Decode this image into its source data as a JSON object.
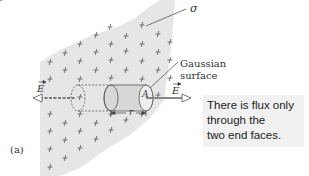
{
  "figure": {
    "part_label": "(a)",
    "sheet_label": "σ",
    "surface_label_line1": "Gaussian",
    "surface_label_line2": "surface",
    "field_left_label": "E",
    "field_right_label": "E",
    "area_label": "A",
    "radius_label": "r",
    "callout": {
      "line1": "There is flux only",
      "line2": "through the",
      "line3": "two end faces."
    },
    "colors": {
      "sheet_fill": "#e6e6e6",
      "charge_mark": "#555555",
      "cylinder_fill": "#d8d8d8",
      "arrow": "#666666",
      "callout_bg": "#f1f1f1"
    }
  }
}
